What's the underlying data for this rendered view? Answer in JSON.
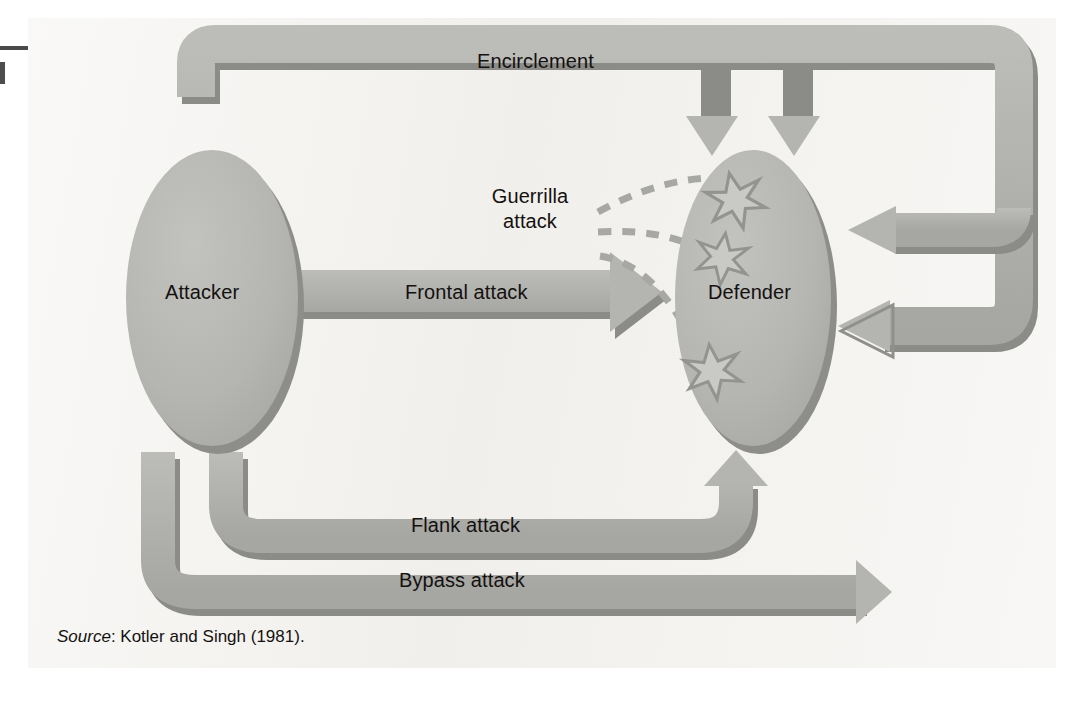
{
  "figure": {
    "nodes": [
      {
        "id": "attacker",
        "label": "Attacker"
      },
      {
        "id": "defender",
        "label": "Defender"
      }
    ],
    "strategies": [
      {
        "id": "encirclement",
        "label": "Encirclement"
      },
      {
        "id": "frontal",
        "label": "Frontal attack"
      },
      {
        "id": "guerrilla",
        "label": "Guerrilla attack"
      },
      {
        "id": "flank",
        "label": "Flank attack"
      },
      {
        "id": "bypass",
        "label": "Bypass attack"
      }
    ],
    "guerrilla_line1": "Guerrilla",
    "guerrilla_line2": "attack",
    "star_count": 3,
    "source_prefix": "Source",
    "source_separator": ": ",
    "source_text": "Kotler and Singh (1981).",
    "colors": {
      "panel_background": "#f2f1ee",
      "page_background": "#ffffff",
      "band_fill": "#b0b0ad",
      "band_shadow": "#8d8d8a",
      "node_fill": "#b6b6b3",
      "node_shadow": "#8d8d8a",
      "star_fill": "#c9c9c6",
      "star_stroke": "#8f8f8c",
      "dashed_line": "#a7a7a4",
      "text": "#14110f"
    }
  }
}
